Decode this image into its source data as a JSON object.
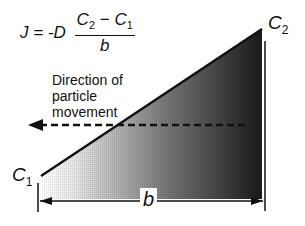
{
  "equation": {
    "lhs": "J",
    "equals": "=",
    "coefficient": "-D",
    "numerator_c2": "C",
    "numerator_c2_sub": "2",
    "minus": "−",
    "numerator_c1": "C",
    "numerator_c1_sub": "1",
    "denominator": "b"
  },
  "labels": {
    "direction_line1": "Direction of",
    "direction_line2": "particle",
    "direction_line3": "movement",
    "c1": "C",
    "c1_sub": "1",
    "c2": "C",
    "c2_sub": "2",
    "b": "b"
  },
  "diagram": {
    "gradient_start_color": "#ffffff",
    "gradient_end_color": "#1a1a1a",
    "line_color": "#111111",
    "arrow_direction": "left"
  }
}
